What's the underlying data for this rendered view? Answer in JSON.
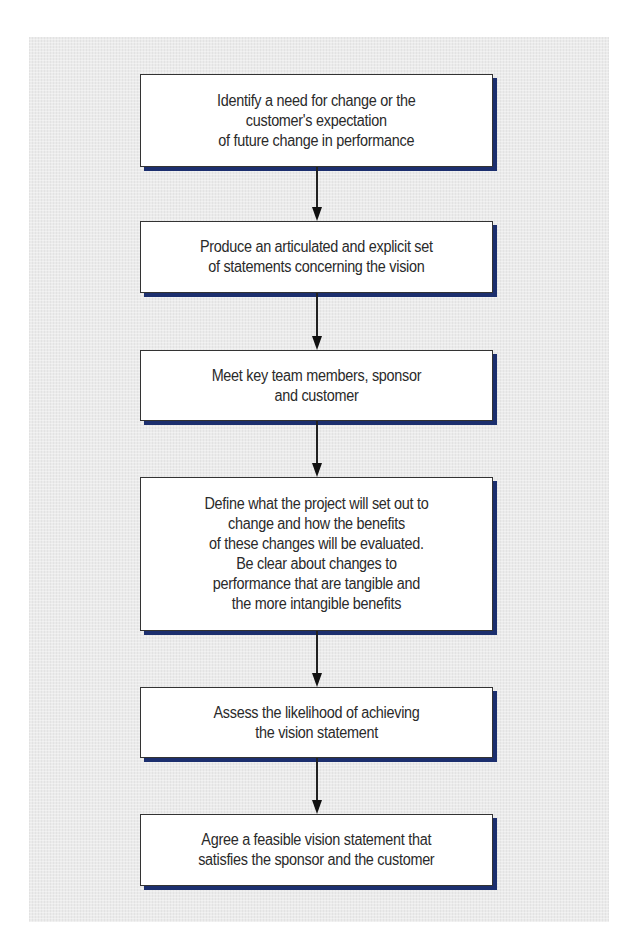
{
  "diagram": {
    "type": "flowchart",
    "direction": "top-to-bottom",
    "colors": {
      "panel_background": "#ebebeb",
      "box_fill": "#ffffff",
      "box_border": "#333333",
      "box_shadow": "#1c2f6e",
      "arrow": "#111111",
      "text": "#2a2a2a"
    },
    "steps": [
      {
        "id": "step-1",
        "label": "Identify a need for change or the\ncustomer's expectation\nof future change in performance"
      },
      {
        "id": "step-2",
        "label": "Produce an articulated and explicit set\nof statements concerning the vision"
      },
      {
        "id": "step-3",
        "label": "Meet key team members, sponsor\nand customer"
      },
      {
        "id": "step-4",
        "label": "Define what the project will set out to\nchange and how the benefits\nof these changes will be evaluated.\nBe clear about changes to\nperformance that are tangible and\nthe more intangible benefits"
      },
      {
        "id": "step-5",
        "label": "Assess the likelihood of achieving\nthe vision statement"
      },
      {
        "id": "step-6",
        "label": "Agree a feasible vision statement that\nsatisfies the sponsor and the customer"
      }
    ],
    "edges": [
      {
        "from": "step-1",
        "to": "step-2"
      },
      {
        "from": "step-2",
        "to": "step-3"
      },
      {
        "from": "step-3",
        "to": "step-4"
      },
      {
        "from": "step-4",
        "to": "step-5"
      },
      {
        "from": "step-5",
        "to": "step-6"
      }
    ]
  }
}
